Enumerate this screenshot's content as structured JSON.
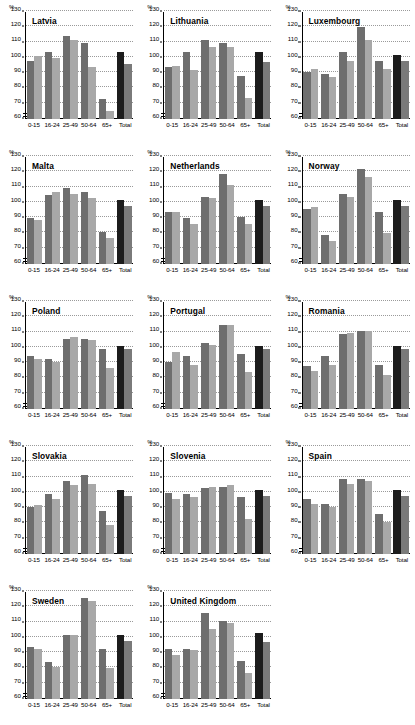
{
  "figure": {
    "y_unit_label": "%",
    "categories": [
      "0-15",
      "16-24",
      "25-49",
      "50-64",
      "65+",
      "Total"
    ],
    "series_names": [
      "series-dark",
      "series-light"
    ],
    "y_ticks": [
      60,
      70,
      80,
      90,
      100,
      110,
      120,
      130
    ],
    "colors": {
      "series_dark": "#6e6e6e",
      "series_light": "#a8a8a8",
      "total_dark": "#1c1c1c",
      "total_light": "#7a7a7a",
      "gridline": "#9a9a9a",
      "axis": "#000000",
      "background": "#ffffff"
    }
  },
  "chart_data": [
    {
      "type": "bar",
      "title": "Latvia",
      "categories": [
        "0-15",
        "16-24",
        "25-49",
        "50-64",
        "65+",
        "Total"
      ],
      "series": [
        {
          "name": "series-dark",
          "values": [
            98,
            104,
            114,
            110,
            73,
            104
          ]
        },
        {
          "name": "series-light",
          "values": [
            101,
            100,
            112,
            94,
            65,
            96
          ]
        }
      ],
      "xlabel": "",
      "ylabel": "%",
      "ylim": [
        60,
        130
      ],
      "grid": true,
      "legend": "none"
    },
    {
      "type": "bar",
      "title": "Lithuania",
      "categories": [
        "0-15",
        "16-24",
        "25-49",
        "50-64",
        "65+",
        "Total"
      ],
      "series": [
        {
          "name": "series-dark",
          "values": [
            94,
            104,
            112,
            110,
            88,
            104
          ]
        },
        {
          "name": "series-light",
          "values": [
            95,
            92,
            107,
            107,
            74,
            97
          ]
        }
      ],
      "xlabel": "",
      "ylabel": "%",
      "ylim": [
        60,
        130
      ],
      "grid": true,
      "legend": "none"
    },
    {
      "type": "bar",
      "title": "Luxembourg",
      "categories": [
        "0-15",
        "16-24",
        "25-49",
        "50-64",
        "65+",
        "Total"
      ],
      "series": [
        {
          "name": "series-dark",
          "values": [
            90.5,
            89.5,
            104,
            120,
            98,
            102
          ]
        },
        {
          "name": "series-light",
          "values": [
            93,
            87.5,
            98,
            112,
            92.5,
            98
          ]
        }
      ],
      "xlabel": "",
      "ylabel": "%",
      "ylim": [
        60,
        130
      ],
      "grid": true,
      "legend": "none"
    },
    {
      "type": "bar",
      "title": "Malta",
      "categories": [
        "0-15",
        "16-24",
        "25-49",
        "50-64",
        "65+",
        "Total"
      ],
      "series": [
        {
          "name": "series-dark",
          "values": [
            90,
            105,
            110,
            107,
            81,
            102
          ]
        },
        {
          "name": "series-light",
          "values": [
            89,
            107,
            106,
            103,
            77,
            98
          ]
        }
      ],
      "xlabel": "",
      "ylabel": "%",
      "ylim": [
        60,
        130
      ],
      "grid": true,
      "legend": "none"
    },
    {
      "type": "bar",
      "title": "Netherlands",
      "categories": [
        "0-15",
        "16-24",
        "25-49",
        "50-64",
        "65+",
        "Total"
      ],
      "series": [
        {
          "name": "series-dark",
          "values": [
            94,
            90,
            104,
            119,
            91,
            102
          ]
        },
        {
          "name": "series-light",
          "values": [
            94,
            86,
            103,
            112,
            86,
            98
          ]
        }
      ],
      "xlabel": "",
      "ylabel": "%",
      "ylim": [
        60,
        130
      ],
      "grid": true,
      "legend": "none"
    },
    {
      "type": "bar",
      "title": "Norway",
      "categories": [
        "0-15",
        "16-24",
        "25-49",
        "50-64",
        "65+",
        "Total"
      ],
      "series": [
        {
          "name": "series-dark",
          "values": [
            96,
            79,
            106,
            122,
            94,
            102
          ]
        },
        {
          "name": "series-light",
          "values": [
            97,
            75,
            104,
            117,
            80,
            98
          ]
        }
      ],
      "xlabel": "",
      "ylabel": "%",
      "ylim": [
        60,
        130
      ],
      "grid": true,
      "legend": "none"
    },
    {
      "type": "bar",
      "title": "Poland",
      "categories": [
        "0-15",
        "16-24",
        "25-49",
        "50-64",
        "65+",
        "Total"
      ],
      "series": [
        {
          "name": "series-dark",
          "values": [
            95,
            92.5,
            106,
            106,
            99,
            101
          ]
        },
        {
          "name": "series-light",
          "values": [
            93,
            90.5,
            107,
            105,
            87,
            99
          ]
        }
      ],
      "xlabel": "",
      "ylabel": "%",
      "ylim": [
        60,
        130
      ],
      "grid": true,
      "legend": "none"
    },
    {
      "type": "bar",
      "title": "Portugal",
      "categories": [
        "0-15",
        "16-24",
        "25-49",
        "50-64",
        "65+",
        "Total"
      ],
      "series": [
        {
          "name": "series-dark",
          "values": [
            91,
            95,
            103,
            115,
            96,
            101
          ]
        },
        {
          "name": "series-light",
          "values": [
            97,
            89,
            102,
            115,
            84,
            99
          ]
        }
      ],
      "xlabel": "",
      "ylabel": "%",
      "ylim": [
        60,
        130
      ],
      "grid": true,
      "legend": "none"
    },
    {
      "type": "bar",
      "title": "Romania",
      "categories": [
        "0-15",
        "16-24",
        "25-49",
        "50-64",
        "65+",
        "Total"
      ],
      "series": [
        {
          "name": "series-dark",
          "values": [
            88,
            95,
            109,
            111,
            89,
            101
          ]
        },
        {
          "name": "series-light",
          "values": [
            85,
            89,
            110,
            111,
            82,
            99
          ]
        }
      ],
      "xlabel": "",
      "ylabel": "%",
      "ylim": [
        60,
        130
      ],
      "grid": true,
      "legend": "none"
    },
    {
      "type": "bar",
      "title": "Slovakia",
      "categories": [
        "0-15",
        "16-24",
        "25-49",
        "50-64",
        "65+",
        "Total"
      ],
      "series": [
        {
          "name": "series-dark",
          "values": [
            91,
            99,
            108,
            112,
            88,
            102
          ]
        },
        {
          "name": "series-light",
          "values": [
            92,
            96,
            105,
            106,
            79,
            98
          ]
        }
      ],
      "xlabel": "",
      "ylabel": "%",
      "ylim": [
        60,
        130
      ],
      "grid": true,
      "legend": "none"
    },
    {
      "type": "bar",
      "title": "Slovenia",
      "categories": [
        "0-15",
        "16-24",
        "25-49",
        "50-64",
        "65+",
        "Total"
      ],
      "series": [
        {
          "name": "series-dark",
          "values": [
            100,
            99,
            103,
            104,
            97,
            102
          ]
        },
        {
          "name": "series-light",
          "values": [
            96,
            97,
            104,
            105,
            83,
            98
          ]
        }
      ],
      "xlabel": "",
      "ylabel": "%",
      "ylim": [
        60,
        130
      ],
      "grid": true,
      "legend": "none"
    },
    {
      "type": "bar",
      "title": "Spain",
      "categories": [
        "0-15",
        "16-24",
        "25-49",
        "50-64",
        "65+",
        "Total"
      ],
      "series": [
        {
          "name": "series-dark",
          "values": [
            96,
            93,
            109,
            109,
            86,
            102
          ]
        },
        {
          "name": "series-light",
          "values": [
            93,
            91,
            106,
            108,
            81,
            98
          ]
        }
      ],
      "xlabel": "",
      "ylabel": "%",
      "ylim": [
        60,
        130
      ],
      "grid": true,
      "legend": "none"
    },
    {
      "type": "bar",
      "title": "Sweden",
      "categories": [
        "0-15",
        "16-24",
        "25-49",
        "50-64",
        "65+",
        "Total"
      ],
      "series": [
        {
          "name": "series-dark",
          "values": [
            94,
            84,
            102,
            126,
            93,
            102
          ]
        },
        {
          "name": "series-light",
          "values": [
            93,
            81,
            102,
            124,
            80,
            98
          ]
        }
      ],
      "xlabel": "",
      "ylabel": "%",
      "ylim": [
        60,
        130
      ],
      "grid": true,
      "legend": "none"
    },
    {
      "type": "bar",
      "title": "United Kingdom",
      "categories": [
        "0-15",
        "16-24",
        "25-49",
        "50-64",
        "65+",
        "Total"
      ],
      "series": [
        {
          "name": "series-dark",
          "values": [
            93,
            93,
            116,
            111,
            85,
            103
          ]
        },
        {
          "name": "series-light",
          "values": [
            89,
            92,
            106,
            110,
            77,
            97
          ]
        }
      ],
      "xlabel": "",
      "ylabel": "%",
      "ylim": [
        60,
        130
      ],
      "grid": true,
      "legend": "none"
    }
  ]
}
